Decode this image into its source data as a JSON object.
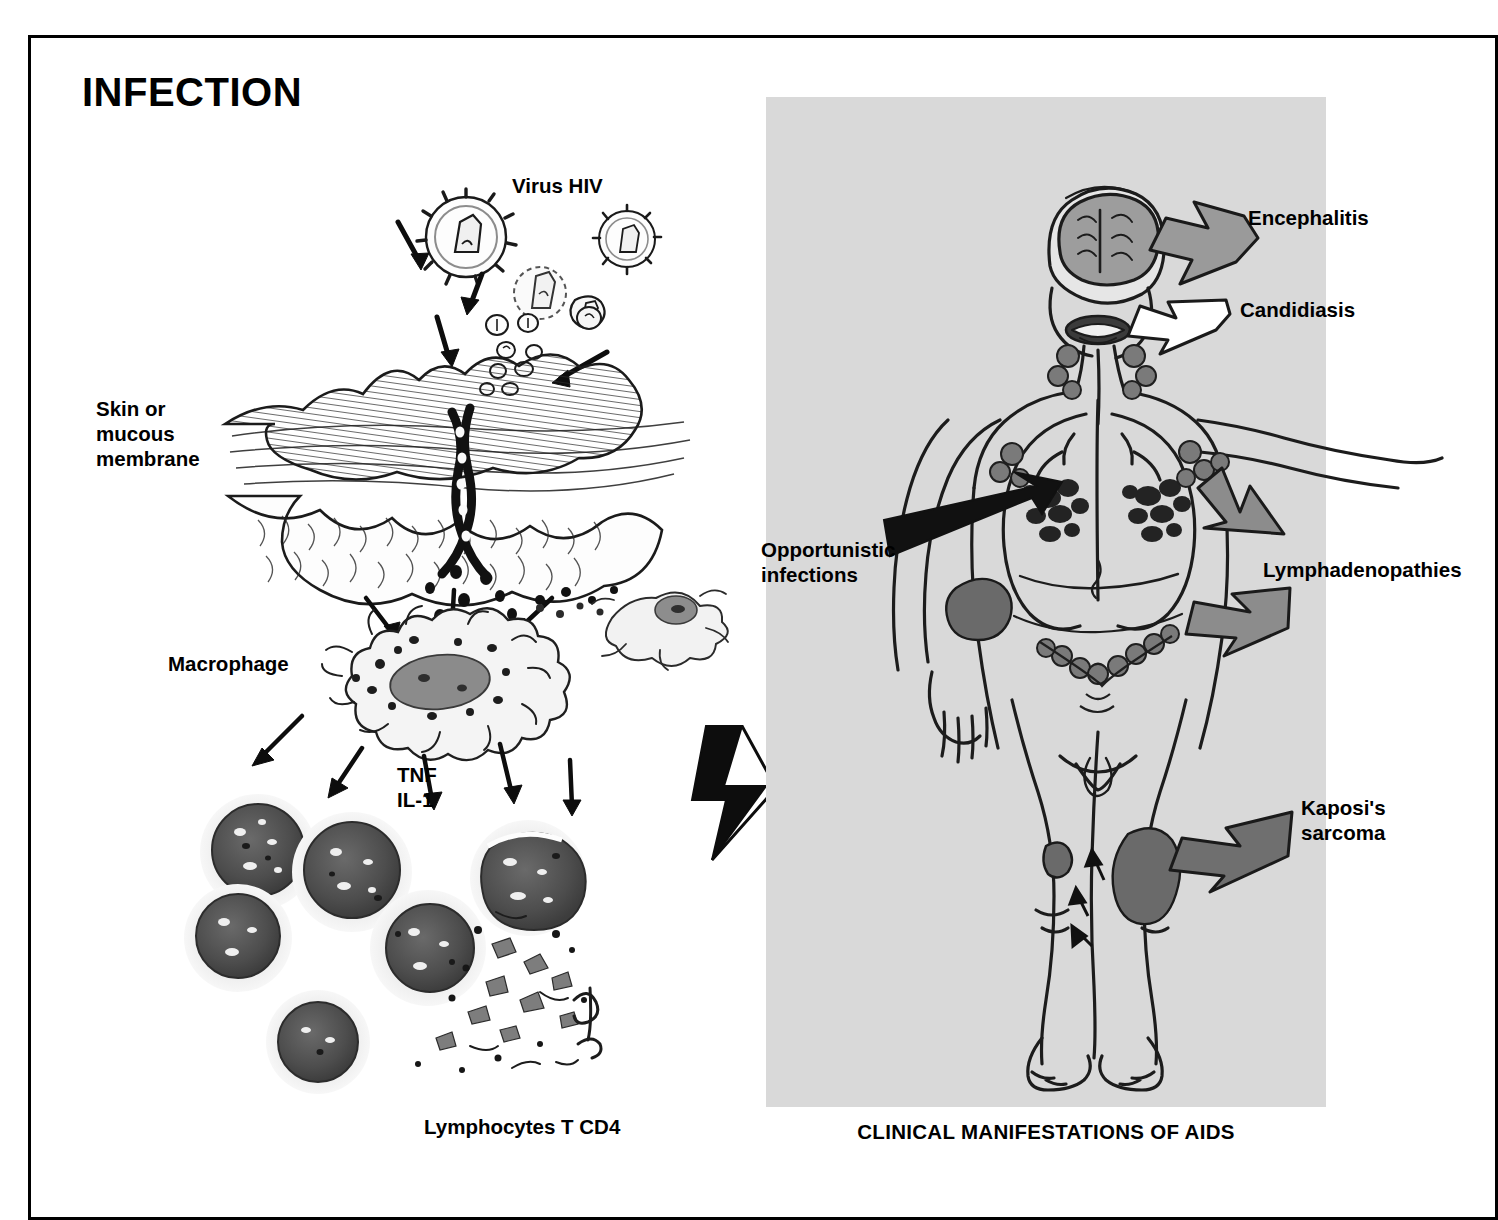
{
  "figure": {
    "panel_title": "INFECTION",
    "caption": "CLINICAL MANIFESTATIONS OF AIDS"
  },
  "left_panel": {
    "labels": {
      "virus": "Virus HIV",
      "skin": "Skin or\nmucous\nmembrane",
      "macrophage": "Macrophage",
      "cytokines": "TNF\nIL-1",
      "lymphocytes": "Lymphocytes T CD4"
    }
  },
  "right_panel": {
    "background_color": "#d9d9d9",
    "labels": {
      "encephalitis": "Encephalitis",
      "candidiasis": "Candidiasis",
      "opportunistic": "Opportunistic\ninfections",
      "lymphadenopathies": "Lymphadenopathies",
      "kaposi": "Kaposi's\nsarcoma"
    }
  },
  "colors": {
    "ink": "#111111",
    "panel_gray": "#d9d9d9",
    "arrow_gray": "#8a8a8a",
    "arrow_white": "#ffffff",
    "arrow_black": "#111111",
    "lesion_gray": "#6e6e6e",
    "cell_dark": "#4a4a4a",
    "cell_halo": "#e3e3e3",
    "nucleus": "#7b7b7b"
  }
}
